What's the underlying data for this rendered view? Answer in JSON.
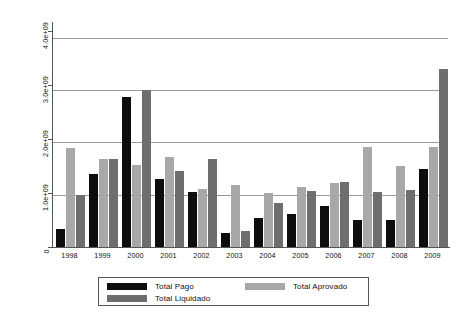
{
  "chart_data": {
    "type": "bar",
    "title": "",
    "subtitle": "",
    "xlabel": "",
    "ylabel": "",
    "categories": [
      "1998",
      "1999",
      "2000",
      "2001",
      "2002",
      "2003",
      "2004",
      "2005",
      "2006",
      "2007",
      "2008",
      "2009"
    ],
    "series": [
      {
        "name": "Total Pago",
        "color": "#0d0d0d",
        "values": [
          350000000,
          1400000000,
          2860000000,
          1300000000,
          1050000000,
          260000000,
          550000000,
          640000000,
          780000000,
          510000000,
          520000000,
          1500000000
        ]
      },
      {
        "name": "Total Aprovado",
        "color": "#a8a8a8",
        "values": [
          1890000000,
          1680000000,
          1560000000,
          1720000000,
          1100000000,
          1190000000,
          1030000000,
          1140000000,
          1230000000,
          1920000000,
          1550000000,
          1920000000
        ]
      },
      {
        "name": "Total Liquidado",
        "color": "#6e6e6e",
        "values": [
          1000000000,
          1680000000,
          3000000000,
          1450000000,
          1680000000,
          310000000,
          840000000,
          1070000000,
          1240000000,
          1060000000,
          1090000000,
          3400000000
        ]
      }
    ],
    "series_order_in_plot": [
      "Total Pago",
      "Total Aprovado",
      "Total Liquidado"
    ],
    "ylim": [
      0,
      4300000000
    ],
    "yticks": [
      0,
      1000000000,
      2000000000,
      3000000000,
      4000000000
    ],
    "ytick_labels": [
      "0",
      "1.0e+09",
      "2.0e+09",
      "3.0e+09",
      "4.0e+09"
    ],
    "grid": true,
    "grid_axis": "y",
    "legend_position": "bottom",
    "legend_entries": [
      {
        "label": "Total Pago",
        "swatch": "pago"
      },
      {
        "label": "Total Liquidado",
        "swatch": "liquidado"
      },
      {
        "label": "Total Aprovado",
        "swatch": "aprovado"
      }
    ]
  }
}
